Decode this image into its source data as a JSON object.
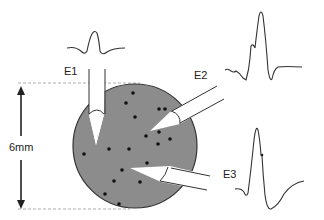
{
  "diagram": {
    "type": "extracellular-recording-schematic",
    "scale_label": "6mm",
    "electrodes": [
      {
        "id": "E1",
        "label": "E1",
        "orientation": "vertical from top"
      },
      {
        "id": "E2",
        "label": "E2",
        "orientation": "diagonal from upper right"
      },
      {
        "id": "E3",
        "label": "E3",
        "orientation": "diagonal from right"
      }
    ],
    "waveforms": [
      {
        "electrode": "E1",
        "shape": "small symmetric biphasic spike"
      },
      {
        "electrode": "E2",
        "shape": "large spike with notch on rising phase"
      },
      {
        "electrode": "E3",
        "shape": "large positive spike followed by slow negative trough"
      }
    ],
    "tissue": {
      "shape": "circle",
      "fill": "#8c8c8c",
      "stroke": "#333333",
      "dots": [
        [
          133,
          93
        ],
        [
          126,
          103
        ],
        [
          135,
          117
        ],
        [
          159,
          109
        ],
        [
          165,
          109
        ],
        [
          159,
          132
        ],
        [
          146,
          136
        ],
        [
          170,
          139
        ],
        [
          158,
          144
        ],
        [
          109,
          149
        ],
        [
          129,
          149
        ],
        [
          84,
          154
        ],
        [
          147,
          163
        ],
        [
          122,
          170
        ],
        [
          114,
          181
        ],
        [
          140,
          182
        ],
        [
          105,
          194
        ],
        [
          119,
          204
        ]
      ]
    },
    "colors": {
      "line": "#333333",
      "tissue": "#8c8c8c",
      "dot": "#111111",
      "dashed": "#999999",
      "electrode_fill": "#ffffff"
    }
  }
}
